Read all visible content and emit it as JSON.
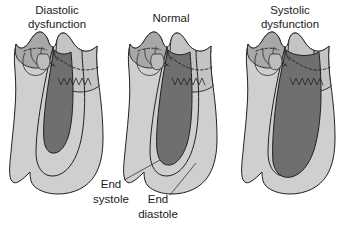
{
  "figure": {
    "kind": "medical-illustration",
    "background_color": "#ffffff",
    "ink_color": "#231f20"
  },
  "palette": {
    "end_diastole_fill": "#cfcfcf",
    "end_systole_fill": "#8d8d8d",
    "cavity_fill": "#6f6f6f",
    "atrium_fill": "#a8a8a8",
    "atrium_light_fill": "#c4c4c4",
    "valve_fill": "#bdbdbd",
    "text_color": "#1a1a1a"
  },
  "panels": [
    {
      "id": "diastolic-dysfunction",
      "title_lines": [
        "Diastolic",
        "dysfunction"
      ],
      "title_x": 57,
      "title_y1": 14,
      "title_y2": 28,
      "offset_x": 0
    },
    {
      "id": "normal",
      "title_lines": [
        "Normal",
        ""
      ],
      "title_x": 171,
      "title_y1": 22,
      "title_y2": 22,
      "offset_x": 114
    },
    {
      "id": "systolic-dysfunction",
      "title_lines": [
        "Systolic",
        "dysfunction"
      ],
      "title_x": 290,
      "title_y1": 14,
      "title_y2": 28,
      "offset_x": 232
    }
  ],
  "callouts": [
    {
      "id": "end-systole",
      "lines": [
        "End",
        "systole"
      ],
      "text_x": 111,
      "text_y1": 188,
      "text_y2": 203,
      "leader": "M 124 180 L 160 160"
    },
    {
      "id": "end-diastole",
      "lines": [
        "End",
        "diastole"
      ],
      "text_x": 158,
      "text_y1": 203,
      "text_y2": 218,
      "leader": "M 170 195 L 196 163"
    }
  ]
}
